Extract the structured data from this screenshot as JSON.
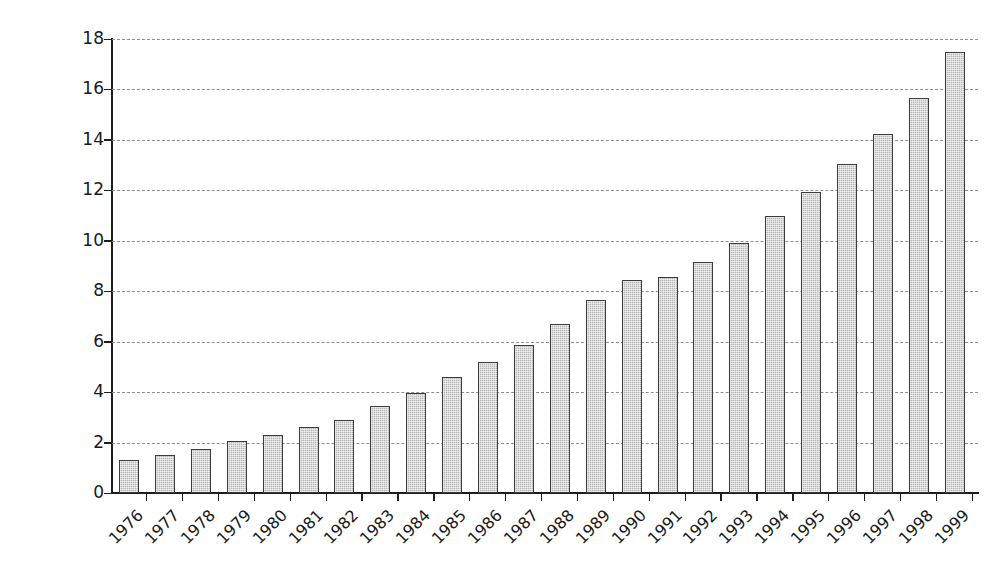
{
  "chart_data": {
    "type": "bar",
    "title": "",
    "subtitle": "",
    "xlabel": "",
    "ylabel": "Billions of liters per year",
    "categories": [
      "1976",
      "1977",
      "1978",
      "1979",
      "1980",
      "1981",
      "1982",
      "1983",
      "1984",
      "1985",
      "1986",
      "1987",
      "1988",
      "1989",
      "1990",
      "1991",
      "1992",
      "1993",
      "1994",
      "1995",
      "1996",
      "1997",
      "1998",
      "1999"
    ],
    "values": [
      1.3,
      1.5,
      1.75,
      2.05,
      2.3,
      2.6,
      2.9,
      3.45,
      3.95,
      4.6,
      5.2,
      5.85,
      6.7,
      7.65,
      8.45,
      8.55,
      9.15,
      9.9,
      11.0,
      11.95,
      13.05,
      14.25,
      15.65,
      17.5
    ],
    "ylim": [
      0,
      18
    ],
    "ytick_labels": [
      "0",
      "2",
      "4",
      "6",
      "8",
      "10",
      "12",
      "14",
      "16",
      "18"
    ],
    "ytick_values": [
      0,
      2,
      4,
      6,
      8,
      10,
      12,
      14,
      16,
      18
    ],
    "grid": "horizontal-dashed",
    "legend": "none",
    "bar_fill_color": "#b5b5b5",
    "bar_edge_color": "#3c3c3c",
    "gridline_color": "#8e8e8e",
    "axis_color": "#1d1d1d",
    "background_color": "#ffffff",
    "xtick_label_rotation": -45
  }
}
